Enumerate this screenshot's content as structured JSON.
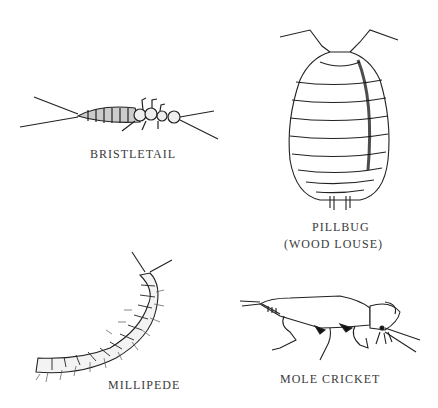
{
  "illustrations": [
    {
      "id": "bristletail",
      "label": "BRISTLETAIL"
    },
    {
      "id": "pillbug",
      "label_line1": "PILLBUG",
      "label_line2": "(WOOD LOUSE)"
    },
    {
      "id": "millipede",
      "label": "MILLIPEDE"
    },
    {
      "id": "mole-cricket",
      "label": "MOLE CRICKET"
    }
  ]
}
